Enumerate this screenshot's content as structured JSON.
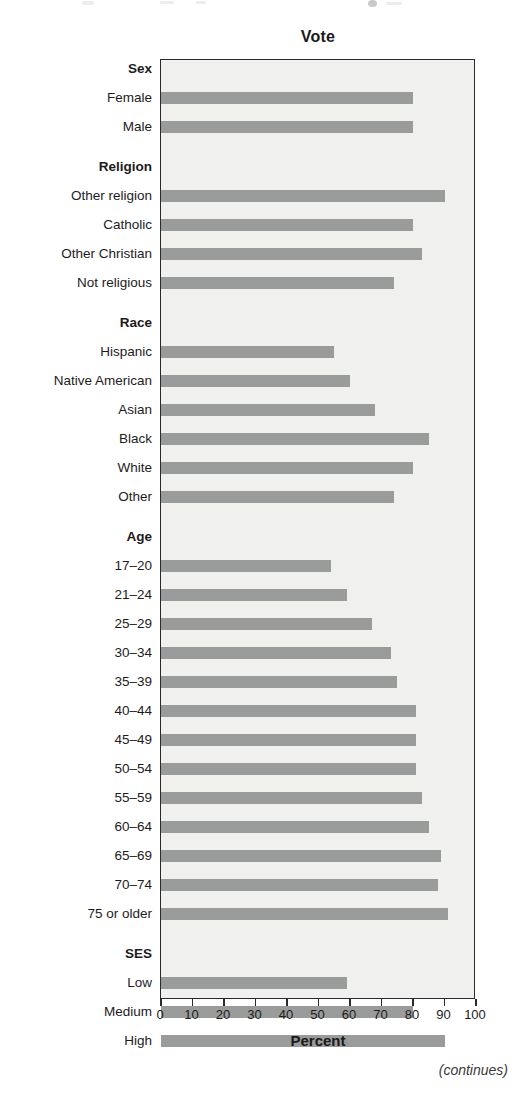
{
  "chart_data": {
    "type": "bar",
    "orientation": "horizontal",
    "title": "Vote",
    "xlabel": "Percent",
    "ylabel": "",
    "xlim": [
      0,
      100
    ],
    "xticks": [
      0,
      10,
      20,
      30,
      40,
      50,
      60,
      70,
      80,
      90,
      100
    ],
    "grid": false,
    "legend": null,
    "bar_color": "#9a9b9b",
    "plot_background": "#f0f0ee",
    "groups": [
      {
        "name": "Sex",
        "categories": [
          "Female",
          "Male"
        ],
        "values": [
          80,
          80
        ]
      },
      {
        "name": "Religion",
        "categories": [
          "Other religion",
          "Catholic",
          "Other Christian",
          "Not religious"
        ],
        "values": [
          90,
          80,
          83,
          74
        ]
      },
      {
        "name": "Race",
        "categories": [
          "Hispanic",
          "Native American",
          "Asian",
          "Black",
          "White",
          "Other"
        ],
        "values": [
          55,
          60,
          68,
          85,
          80,
          74
        ]
      },
      {
        "name": "Age",
        "categories": [
          "17–20",
          "21–24",
          "25–29",
          "30–34",
          "35–39",
          "40–44",
          "45–49",
          "50–54",
          "55–59",
          "60–64",
          "65–69",
          "70–74",
          "75 or older"
        ],
        "values": [
          54,
          59,
          67,
          73,
          75,
          81,
          81,
          81,
          83,
          85,
          89,
          88,
          91
        ]
      },
      {
        "name": "SES",
        "categories": [
          "Low",
          "Medium",
          "High"
        ],
        "values": [
          59,
          80,
          90
        ]
      }
    ]
  },
  "footer": {
    "continues_note": "(continues)"
  }
}
